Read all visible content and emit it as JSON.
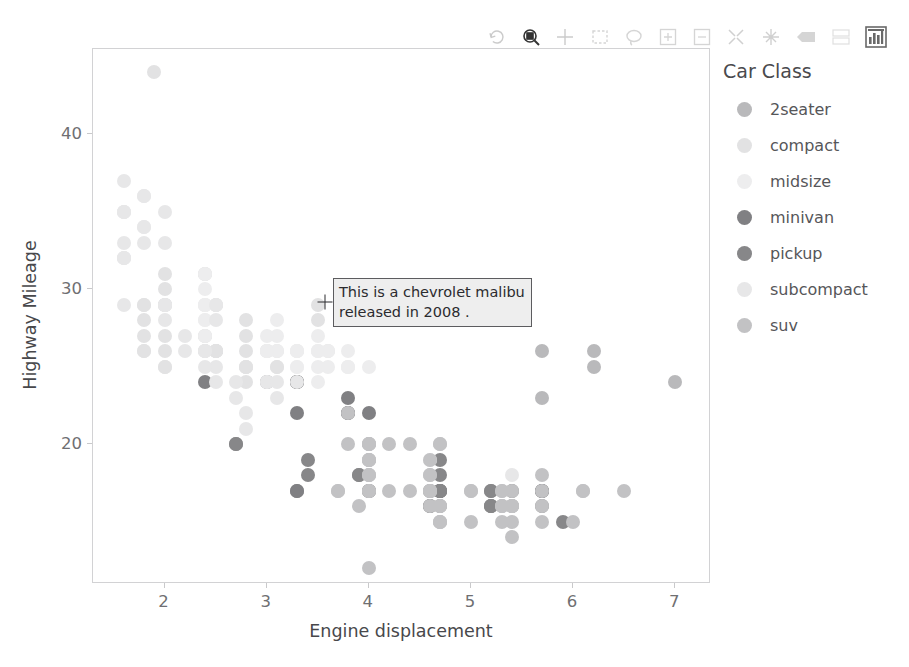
{
  "toolbar": {
    "tools": [
      {
        "name": "reset-tool",
        "label": "Reset",
        "state": "dim"
      },
      {
        "name": "box-zoom-tool",
        "label": "Box Zoom",
        "state": "active"
      },
      {
        "name": "crosshair-tool",
        "label": "Crosshair",
        "state": "dim"
      },
      {
        "name": "box-select-tool",
        "label": "Box Select",
        "state": "dim"
      },
      {
        "name": "lasso-select-tool",
        "label": "Lasso Select",
        "state": "dim"
      },
      {
        "name": "zoom-in-tool",
        "label": "Zoom In",
        "state": "dim"
      },
      {
        "name": "zoom-out-tool",
        "label": "Zoom Out",
        "state": "dim"
      },
      {
        "name": "wheel-zoom-tool",
        "label": "Wheel Zoom",
        "state": "dim"
      },
      {
        "name": "pan-tool",
        "label": "Pan",
        "state": "dim"
      },
      {
        "name": "save-tool",
        "label": "Save",
        "state": "dim"
      },
      {
        "name": "hover-tool",
        "label": "Hover",
        "state": "dim"
      },
      {
        "name": "bokeh-logo",
        "label": "Bokeh",
        "state": "strong"
      }
    ]
  },
  "legend": {
    "title": "Car Class",
    "items": [
      {
        "label": "2seater",
        "color": "#b9b9bb"
      },
      {
        "label": "compact",
        "color": "#e2e2e3"
      },
      {
        "label": "midsize",
        "color": "#ededee"
      },
      {
        "label": "minivan",
        "color": "#808083"
      },
      {
        "label": "pickup",
        "color": "#878789"
      },
      {
        "label": "subcompact",
        "color": "#e7e7e8"
      },
      {
        "label": "suv",
        "color": "#c2c2c4"
      }
    ]
  },
  "annotation": {
    "text": "This is a chevrolet malibu\nreleased in 2008 .",
    "marker": "crosshair",
    "x_value": 3.6,
    "y_value": 28.6
  },
  "chart_data": {
    "type": "scatter",
    "title": "",
    "xlabel": "Engine displacement",
    "ylabel": "Highway Mileage",
    "xlim": [
      1.3,
      7.35
    ],
    "ylim": [
      11.0,
      45.5
    ],
    "xticks": [
      2,
      3,
      4,
      5,
      6,
      7
    ],
    "yticks": [
      20,
      30,
      40
    ],
    "grid": false,
    "legend_position": "right",
    "legend_title": "Car Class",
    "marker_size_px": 14,
    "series": [
      {
        "name": "2seater",
        "color": "#b9b9bb",
        "points": [
          [
            5.7,
            26
          ],
          [
            5.7,
            23
          ],
          [
            6.2,
            26
          ],
          [
            6.2,
            25
          ],
          [
            7.0,
            24
          ]
        ]
      },
      {
        "name": "compact",
        "color": "#e2e2e3",
        "points": [
          [
            1.8,
            29
          ],
          [
            1.8,
            29
          ],
          [
            2.0,
            31
          ],
          [
            2.0,
            30
          ],
          [
            1.8,
            26
          ],
          [
            1.8,
            26
          ],
          [
            2.0,
            27
          ],
          [
            2.0,
            26
          ],
          [
            2.8,
            25
          ],
          [
            2.8,
            25
          ],
          [
            3.1,
            25
          ],
          [
            1.8,
            28
          ],
          [
            1.8,
            27
          ],
          [
            2.0,
            25
          ],
          [
            2.0,
            25
          ],
          [
            2.8,
            25
          ],
          [
            2.8,
            24
          ],
          [
            3.1,
            25
          ],
          [
            3.1,
            26
          ],
          [
            2.4,
            27
          ],
          [
            2.4,
            26
          ],
          [
            2.5,
            26
          ],
          [
            2.5,
            26
          ],
          [
            3.3,
            24
          ],
          [
            2.0,
            29
          ],
          [
            2.0,
            29
          ],
          [
            2.8,
            26
          ],
          [
            1.9,
            44
          ],
          [
            2.0,
            29
          ],
          [
            2.0,
            29
          ],
          [
            2.5,
            29
          ],
          [
            2.5,
            29
          ],
          [
            2.8,
            28
          ],
          [
            2.8,
            27
          ],
          [
            3.6,
            26
          ],
          [
            2.4,
            31
          ],
          [
            2.4,
            31
          ],
          [
            2.5,
            26
          ],
          [
            2.5,
            26
          ],
          [
            3.5,
            28
          ],
          [
            3.5,
            29
          ],
          [
            3.0,
            26
          ],
          [
            3.0,
            26
          ],
          [
            3.3,
            26
          ],
          [
            2.4,
            27
          ],
          [
            2.4,
            26
          ],
          [
            2.5,
            26
          ]
        ]
      },
      {
        "name": "midsize",
        "color": "#ededee",
        "points": [
          [
            2.4,
            29
          ],
          [
            2.4,
            29
          ],
          [
            3.1,
            27
          ],
          [
            3.5,
            26
          ],
          [
            2.4,
            31
          ],
          [
            2.4,
            30
          ],
          [
            3.0,
            26
          ],
          [
            3.3,
            26
          ],
          [
            2.4,
            29
          ],
          [
            2.4,
            27
          ],
          [
            3.0,
            26
          ],
          [
            3.5,
            27
          ],
          [
            3.1,
            26
          ],
          [
            3.8,
            25
          ],
          [
            3.8,
            25
          ],
          [
            3.0,
            27
          ],
          [
            3.3,
            26
          ],
          [
            3.3,
            25
          ],
          [
            3.5,
            26
          ],
          [
            3.5,
            25
          ],
          [
            3.8,
            26
          ],
          [
            3.8,
            25
          ],
          [
            4.0,
            25
          ],
          [
            2.4,
            28
          ],
          [
            2.4,
            28
          ],
          [
            3.0,
            26
          ],
          [
            3.0,
            26
          ],
          [
            3.3,
            25
          ],
          [
            3.5,
            24
          ],
          [
            3.5,
            26
          ],
          [
            3.6,
            25
          ],
          [
            2.4,
            29
          ],
          [
            2.4,
            29
          ],
          [
            3.1,
            28
          ],
          [
            3.6,
            26
          ]
        ]
      },
      {
        "name": "minivan",
        "color": "#808083",
        "points": [
          [
            2.4,
            24
          ],
          [
            3.0,
            24
          ],
          [
            3.3,
            24
          ],
          [
            3.3,
            22
          ],
          [
            3.3,
            24
          ],
          [
            3.3,
            24
          ],
          [
            3.8,
            22
          ],
          [
            3.8,
            22
          ],
          [
            3.8,
            23
          ],
          [
            4.0,
            22
          ],
          [
            3.3,
            17
          ],
          [
            3.3,
            17
          ]
        ]
      },
      {
        "name": "pickup",
        "color": "#878789",
        "points": [
          [
            4.7,
            19
          ],
          [
            5.7,
            17
          ],
          [
            4.7,
            17
          ],
          [
            4.7,
            17
          ],
          [
            5.2,
            17
          ],
          [
            5.2,
            17
          ],
          [
            3.9,
            18
          ],
          [
            3.9,
            18
          ],
          [
            4.7,
            17
          ],
          [
            4.7,
            17
          ],
          [
            4.7,
            16
          ],
          [
            5.2,
            16
          ],
          [
            5.7,
            17
          ],
          [
            5.9,
            15
          ],
          [
            4.7,
            17
          ],
          [
            4.7,
            18
          ],
          [
            4.7,
            17
          ],
          [
            5.2,
            16
          ],
          [
            5.2,
            16
          ],
          [
            5.7,
            16
          ],
          [
            5.7,
            17
          ],
          [
            2.7,
            20
          ],
          [
            2.7,
            20
          ],
          [
            3.4,
            19
          ],
          [
            3.4,
            18
          ],
          [
            4.0,
            17
          ],
          [
            4.0,
            17
          ],
          [
            4.0,
            17
          ],
          [
            4.6,
            16
          ],
          [
            4.6,
            16
          ],
          [
            4.6,
            17
          ],
          [
            5.4,
            16
          ],
          [
            5.4,
            17
          ]
        ]
      },
      {
        "name": "subcompact",
        "color": "#e7e7e8",
        "points": [
          [
            1.6,
            33
          ],
          [
            1.6,
            32
          ],
          [
            1.6,
            32
          ],
          [
            1.6,
            29
          ],
          [
            1.6,
            32
          ],
          [
            1.8,
            34
          ],
          [
            1.8,
            36
          ],
          [
            1.8,
            36
          ],
          [
            2.0,
            29
          ],
          [
            2.4,
            26
          ],
          [
            2.5,
            28
          ],
          [
            2.5,
            29
          ],
          [
            3.3,
            24
          ],
          [
            2.0,
            28
          ],
          [
            2.0,
            29
          ],
          [
            2.0,
            29
          ],
          [
            2.5,
            25
          ],
          [
            2.5,
            24
          ],
          [
            2.7,
            23
          ],
          [
            2.7,
            24
          ],
          [
            3.0,
            24
          ],
          [
            3.0,
            24
          ],
          [
            1.6,
            35
          ],
          [
            1.6,
            37
          ],
          [
            1.6,
            35
          ],
          [
            1.6,
            35
          ],
          [
            1.8,
            33
          ],
          [
            1.8,
            34
          ],
          [
            2.0,
            33
          ],
          [
            2.0,
            35
          ],
          [
            2.8,
            22
          ],
          [
            2.8,
            21
          ],
          [
            3.1,
            23
          ],
          [
            3.1,
            24
          ],
          [
            4.6,
            19
          ],
          [
            5.4,
            18
          ],
          [
            2.2,
            26
          ],
          [
            2.2,
            27
          ],
          [
            2.4,
            26
          ],
          [
            2.4,
            25
          ]
        ]
      },
      {
        "name": "suv",
        "color": "#c2c2c4",
        "points": [
          [
            4.0,
            19
          ],
          [
            4.0,
            19
          ],
          [
            4.6,
            18
          ],
          [
            5.0,
            17
          ],
          [
            4.0,
            19
          ],
          [
            4.0,
            18
          ],
          [
            4.6,
            17
          ],
          [
            5.0,
            17
          ],
          [
            4.0,
            17
          ],
          [
            4.0,
            18
          ],
          [
            4.6,
            17
          ],
          [
            4.6,
            17
          ],
          [
            5.4,
            17
          ],
          [
            4.0,
            19
          ],
          [
            4.6,
            18
          ],
          [
            4.6,
            17
          ],
          [
            4.6,
            17
          ],
          [
            5.4,
            16
          ],
          [
            3.8,
            22
          ],
          [
            3.8,
            20
          ],
          [
            4.0,
            20
          ],
          [
            4.0,
            20
          ],
          [
            4.7,
            16
          ],
          [
            4.7,
            16
          ],
          [
            5.7,
            17
          ],
          [
            6.1,
            17
          ],
          [
            4.0,
            18
          ],
          [
            4.2,
            17
          ],
          [
            4.4,
            17
          ],
          [
            4.6,
            17
          ],
          [
            5.4,
            16
          ],
          [
            5.4,
            16
          ],
          [
            4.0,
            17
          ],
          [
            4.0,
            17
          ],
          [
            4.6,
            16
          ],
          [
            5.0,
            15
          ],
          [
            4.2,
            20
          ],
          [
            4.4,
            20
          ],
          [
            4.6,
            19
          ],
          [
            5.4,
            15
          ],
          [
            5.4,
            14
          ],
          [
            4.0,
            20
          ],
          [
            4.0,
            20
          ],
          [
            4.7,
            20
          ],
          [
            4.7,
            20
          ],
          [
            5.7,
            18
          ],
          [
            6.1,
            17
          ],
          [
            4.0,
            12
          ],
          [
            4.7,
            15
          ],
          [
            5.3,
            17
          ],
          [
            5.3,
            17
          ],
          [
            5.3,
            16
          ],
          [
            5.7,
            15
          ],
          [
            6.0,
            15
          ],
          [
            5.3,
            16
          ],
          [
            5.3,
            16
          ],
          [
            5.3,
            15
          ],
          [
            5.7,
            16
          ],
          [
            6.5,
            17
          ],
          [
            3.7,
            17
          ],
          [
            3.7,
            17
          ],
          [
            3.9,
            16
          ],
          [
            4.7,
            15
          ],
          [
            4.7,
            15
          ]
        ]
      }
    ]
  }
}
